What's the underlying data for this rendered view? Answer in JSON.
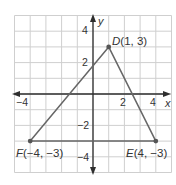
{
  "diagram": {
    "type": "coordinate-plane-triangle",
    "axes": {
      "x_label": "x",
      "y_label": "y",
      "x_range": [
        -5,
        5
      ],
      "y_range": [
        -5,
        5
      ],
      "x_ticks": [
        {
          "value": -4,
          "label": "−4"
        },
        {
          "value": 2,
          "label": "2"
        },
        {
          "value": 4,
          "label": "4"
        }
      ],
      "y_ticks": [
        {
          "value": 4,
          "label": "4"
        },
        {
          "value": 2,
          "label": "2"
        },
        {
          "value": -2,
          "label": "−2"
        },
        {
          "value": -4,
          "label": "−4"
        }
      ]
    },
    "points": [
      {
        "name": "D",
        "x": 1,
        "y": 3,
        "coords": "(1, 3)"
      },
      {
        "name": "E",
        "x": 4,
        "y": -3,
        "coords": "(4, −3)"
      },
      {
        "name": "F",
        "x": -4,
        "y": -3,
        "coords": "(−4, −3)"
      }
    ],
    "triangle": [
      "D",
      "E",
      "F"
    ],
    "colors": {
      "grid": "#cfcfcf",
      "axis": "#2e2e2e",
      "edge": "#666666",
      "point": "#555555",
      "text": "#333333"
    }
  }
}
